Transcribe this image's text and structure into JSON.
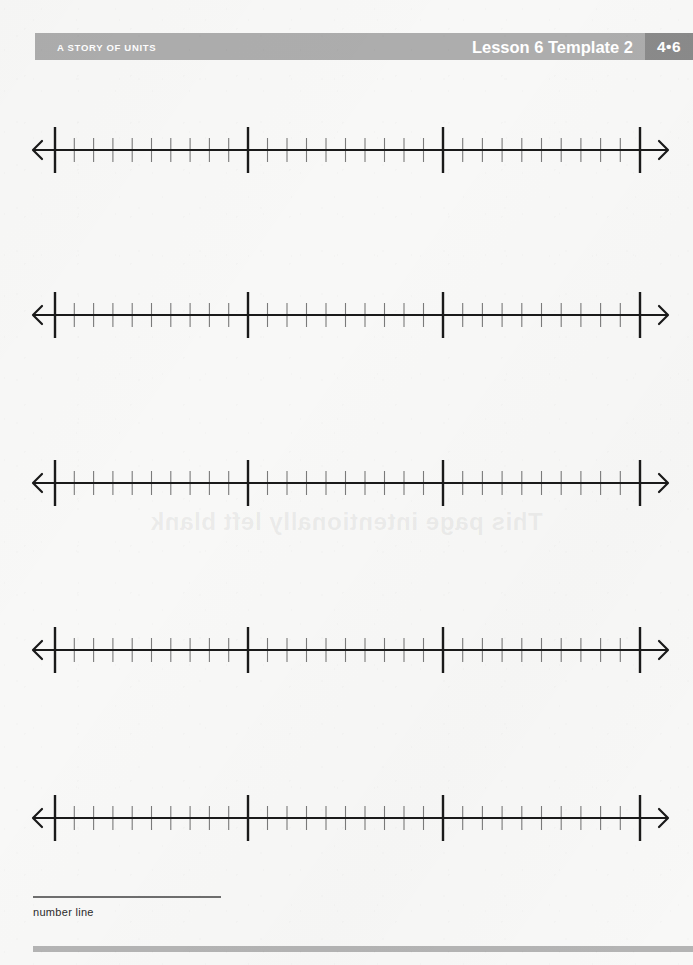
{
  "page": {
    "background_color": "#f8f8f7",
    "width": 693,
    "height": 965
  },
  "header": {
    "band_color": "#adadad",
    "badge_color": "#8a8a8a",
    "text_color": "#ffffff",
    "series_title": "A STORY OF UNITS",
    "lesson_label": "Lesson 6 Template 2",
    "badge_label": "4•6"
  },
  "watermark": {
    "text": "This page intentionally left blank",
    "mirrored": "true"
  },
  "worksheet": {
    "line_color": "#1a1a1a",
    "minor_tick_color": "#7a7a7a",
    "axis_start_x": 33,
    "axis_end_x": 668,
    "major_tick_positions": [
      55,
      248,
      443,
      640
    ],
    "minor_ticks_per_interval": 9,
    "major_tick_height": 46,
    "minor_tick_height": 24,
    "number_lines": [
      {
        "id": "number-line-1",
        "center_y": 150
      },
      {
        "id": "number-line-2",
        "center_y": 315
      },
      {
        "id": "number-line-3",
        "center_y": 483
      },
      {
        "id": "number-line-4",
        "center_y": 650
      },
      {
        "id": "number-line-5",
        "center_y": 818
      }
    ]
  },
  "footer": {
    "caption": "number line",
    "bar_color": "#b4b4b4",
    "rule_color": "#6e6e6e"
  }
}
